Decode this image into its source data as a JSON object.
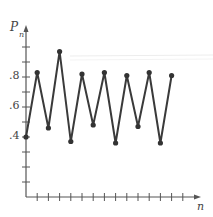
{
  "chart_data": {
    "type": "line",
    "title": "",
    "xlabel": "n",
    "ylabel": "P",
    "ylabel_subscript": "n",
    "y_tick_labels": [
      ".4",
      ".6",
      ".8"
    ],
    "y_ticks": [
      0.1,
      0.2,
      0.3,
      0.4,
      0.5,
      0.6,
      0.7,
      0.8,
      0.9,
      1.0
    ],
    "ylim": [
      0,
      1.0
    ],
    "x_ticks": [
      1,
      2,
      3,
      4,
      5,
      6,
      7,
      8,
      9,
      10,
      11,
      12,
      13,
      14
    ],
    "x_tick_labels": [],
    "xlim": [
      0,
      15
    ],
    "grid": false,
    "legend": null,
    "series": [
      {
        "name": "P_n",
        "x": [
          0,
          1,
          2,
          3,
          4,
          5,
          6,
          7,
          8,
          9,
          10,
          11,
          12,
          13
        ],
        "values": [
          0.4,
          0.83,
          0.46,
          0.97,
          0.37,
          0.82,
          0.48,
          0.83,
          0.36,
          0.81,
          0.47,
          0.83,
          0.36,
          0.81
        ]
      }
    ]
  },
  "labels": {
    "y_axis": "P",
    "y_axis_sub": "n",
    "x_axis": "n",
    "tick_08": ".8",
    "tick_06": ".6",
    "tick_04": ".4"
  },
  "colors": {
    "line": "#3a3a3a",
    "axis": "#555555",
    "point": "#333333"
  }
}
